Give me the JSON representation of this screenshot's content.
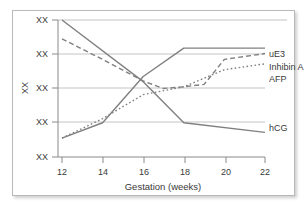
{
  "chart_data": {
    "type": "line",
    "title": "",
    "xlabel": "Gestation (weeks)",
    "ylabel": "XX",
    "xlim": [
      12,
      22
    ],
    "ylim": [
      0,
      4
    ],
    "xticks": [
      "12",
      "14",
      "16",
      "18",
      "20",
      "22"
    ],
    "xtick_values": [
      12,
      14,
      16,
      18,
      20,
      22
    ],
    "yticks": [
      "XX",
      "XX",
      "XX",
      "XX",
      "XX"
    ],
    "ytick_values": [
      4,
      3,
      2,
      1,
      0
    ],
    "grid": "horizontal",
    "legend_position": "right",
    "series": [
      {
        "name": "uE3",
        "style": "solid",
        "x": [
          12,
          14,
          16,
          18,
          22
        ],
        "y": [
          0.55,
          1.0,
          2.35,
          3.18,
          3.18
        ]
      },
      {
        "name": "Inhibin A",
        "style": "dashed",
        "x": [
          12,
          14,
          16,
          17,
          18,
          19,
          20,
          22
        ],
        "y": [
          3.45,
          2.85,
          2.22,
          2.0,
          2.05,
          2.12,
          2.85,
          3.02
        ]
      },
      {
        "name": "AFP",
        "style": "dotted",
        "x": [
          12,
          14,
          16,
          18,
          20,
          22
        ],
        "y": [
          0.55,
          1.12,
          1.82,
          2.05,
          2.55,
          2.72
        ]
      },
      {
        "name": "hCG",
        "style": "solid",
        "x": [
          12,
          16,
          18,
          22
        ],
        "y": [
          4.0,
          2.2,
          1.0,
          0.72
        ]
      }
    ],
    "legend_entries": [
      {
        "label": "uE3",
        "style": "solid"
      },
      {
        "label": "Inhibin A",
        "style": "dashed"
      },
      {
        "label": "AFP",
        "style": "dotted"
      },
      {
        "label": "hCG",
        "style": "solid"
      }
    ]
  }
}
